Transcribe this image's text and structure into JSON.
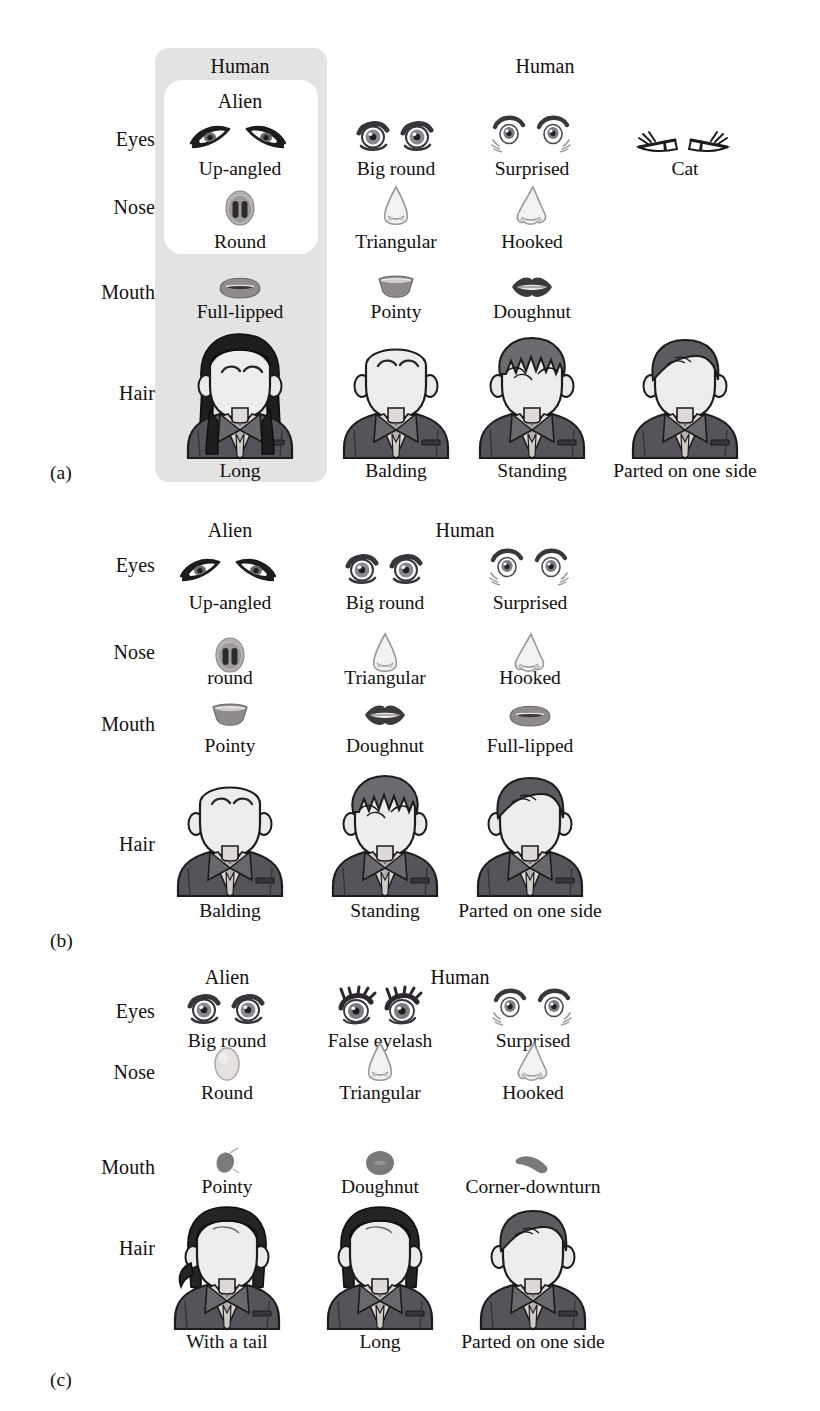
{
  "figure": {
    "kind": "avatar-feature-selection-figure",
    "row_labels": [
      "Eyes",
      "Nose",
      "Mouth",
      "Hair"
    ],
    "group_headers": [
      "Alien",
      "Human"
    ]
  },
  "panels": [
    {
      "id": "(a)",
      "headers": [
        {
          "text": "Human",
          "x": 240
        },
        {
          "text": "Human",
          "x": 545
        }
      ],
      "inner_header": {
        "text": "Alien",
        "x": 240
      },
      "highlight": {
        "note": "gray column highlight with white inset around Alien eyes and nose"
      },
      "rows": [
        {
          "label": "Eyes",
          "items": [
            {
              "icon": "eyes-up-angled-icon",
              "caption": "Up-angled",
              "x": 240
            },
            {
              "icon": "eyes-big-round-icon",
              "caption": "Big round",
              "x": 396
            },
            {
              "icon": "eyes-surprised-icon",
              "caption": "Surprised",
              "x": 532
            },
            {
              "icon": "eyes-cat-icon",
              "caption": "Cat",
              "x": 685
            }
          ]
        },
        {
          "label": "Nose",
          "items": [
            {
              "icon": "nose-round-icon",
              "caption": "Round",
              "x": 240
            },
            {
              "icon": "nose-triangular-icon",
              "caption": "Triangular",
              "x": 396
            },
            {
              "icon": "nose-hooked-icon",
              "caption": "Hooked",
              "x": 532
            }
          ]
        },
        {
          "label": "Mouth",
          "items": [
            {
              "icon": "mouth-full-lipped-icon",
              "caption": "Full-lipped",
              "x": 240
            },
            {
              "icon": "mouth-pointy-icon",
              "caption": "Pointy",
              "x": 396
            },
            {
              "icon": "mouth-doughnut-icon",
              "caption": "Doughnut",
              "x": 532
            }
          ]
        },
        {
          "label": "Hair",
          "items": [
            {
              "icon": "avatar-hair-long-icon",
              "caption": "Long",
              "x": 240
            },
            {
              "icon": "avatar-hair-balding-icon",
              "caption": "Balding",
              "x": 396
            },
            {
              "icon": "avatar-hair-standing-icon",
              "caption": "Standing",
              "x": 532
            },
            {
              "icon": "avatar-hair-parted-icon",
              "caption": "Parted on one side",
              "x": 685
            }
          ]
        }
      ]
    },
    {
      "id": "(b)",
      "headers": [
        {
          "text": "Alien",
          "x": 230
        },
        {
          "text": "Human",
          "x": 465
        }
      ],
      "rows": [
        {
          "label": "Eyes",
          "items": [
            {
              "icon": "eyes-up-angled-icon",
              "caption": "Up-angled",
              "x": 230
            },
            {
              "icon": "eyes-big-round-icon",
              "caption": "Big round",
              "x": 385
            },
            {
              "icon": "eyes-surprised-icon",
              "caption": "Surprised",
              "x": 530
            }
          ]
        },
        {
          "label": "Nose",
          "items": [
            {
              "icon": "nose-round-icon",
              "caption": "round",
              "x": 230
            },
            {
              "icon": "nose-triangular-icon",
              "caption": "Triangular",
              "x": 385
            },
            {
              "icon": "nose-hooked-icon",
              "caption": "Hooked",
              "x": 530
            }
          ]
        },
        {
          "label": "Mouth",
          "items": [
            {
              "icon": "mouth-pointy-icon",
              "caption": "Pointy",
              "x": 230
            },
            {
              "icon": "mouth-doughnut-icon",
              "caption": "Doughnut",
              "x": 385
            },
            {
              "icon": "mouth-full-lipped-icon",
              "caption": "Full-lipped",
              "x": 530
            }
          ]
        },
        {
          "label": "Hair",
          "items": [
            {
              "icon": "avatar-hair-balding-icon",
              "caption": "Balding",
              "x": 230
            },
            {
              "icon": "avatar-hair-standing-icon",
              "caption": "Standing",
              "x": 385
            },
            {
              "icon": "avatar-hair-parted-icon",
              "caption": "Parted on one side",
              "x": 530
            }
          ]
        }
      ]
    },
    {
      "id": "(c)",
      "headers": [
        {
          "text": "Alien",
          "x": 227
        },
        {
          "text": "Human",
          "x": 460
        }
      ],
      "rows": [
        {
          "label": "Eyes",
          "items": [
            {
              "icon": "eyes-big-round-icon",
              "caption": "Big round",
              "x": 227
            },
            {
              "icon": "eyes-false-eyelash-icon",
              "caption": "False eyelash",
              "x": 380
            },
            {
              "icon": "eyes-surprised-icon",
              "caption": "Surprised",
              "x": 533
            }
          ]
        },
        {
          "label": "Nose",
          "items": [
            {
              "icon": "nose-round-ball-icon",
              "caption": "Round",
              "x": 227
            },
            {
              "icon": "nose-triangular-icon",
              "caption": "Triangular",
              "x": 380
            },
            {
              "icon": "nose-hooked-icon",
              "caption": "Hooked",
              "x": 533
            }
          ]
        },
        {
          "label": "Mouth",
          "items": [
            {
              "icon": "mouth-pointy-blob-icon",
              "caption": "Pointy",
              "x": 227
            },
            {
              "icon": "mouth-doughnut-round-icon",
              "caption": "Doughnut",
              "x": 380
            },
            {
              "icon": "mouth-corner-downturn-icon",
              "caption": "Corner-downturn",
              "x": 533
            }
          ]
        },
        {
          "label": "Hair",
          "items": [
            {
              "icon": "avatar-hair-with-a-tail-icon",
              "caption": "With a tail",
              "x": 227
            },
            {
              "icon": "avatar-hair-long-icon",
              "caption": "Long",
              "x": 380
            },
            {
              "icon": "avatar-hair-parted-icon",
              "caption": "Parted on one side",
              "x": 533
            }
          ]
        }
      ]
    }
  ],
  "colors": {
    "ink": "#14100e",
    "highlight_gray": "#e3e3e3",
    "highlight_inner": "#ffffff",
    "suit_dark": "#55545a",
    "suit_outline": "#1d1b1c",
    "hair_dark": "#2a2527",
    "hair_mid": "#6d686b",
    "skin": "#eceaea",
    "nose_fill": "#f2f0ee",
    "mouth_gray": "#8f8c8e"
  }
}
